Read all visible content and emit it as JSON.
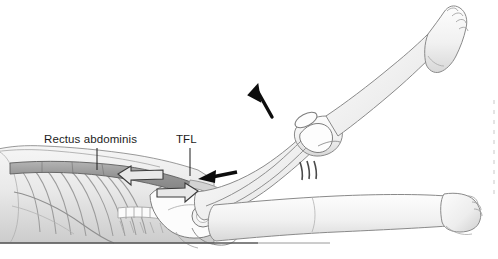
{
  "figure": {
    "background_color": "#ffffff",
    "width": 498,
    "height": 259,
    "style": "grayscale anatomical line drawing"
  },
  "labels": [
    {
      "id": "rectus-abdominis",
      "text": "Rectus abdominis",
      "x": 44,
      "y": 143,
      "leader_line": {
        "x1": 97,
        "y1": 148,
        "x2": 97,
        "y2": 170
      }
    },
    {
      "id": "tfl",
      "text": "TFL",
      "x": 176,
      "y": 143,
      "leader_line": {
        "x1": 190,
        "y1": 148,
        "x2": 190,
        "y2": 176
      }
    }
  ],
  "annotations": {
    "solid_arrows": [
      {
        "id": "leg-raise-arrow",
        "direction": "up-left",
        "color": "#0d0d0d",
        "x": 268,
        "y": 103
      },
      {
        "id": "hip-force-arrow",
        "direction": "left",
        "color": "#0d0d0d",
        "x": 216,
        "y": 176
      }
    ],
    "outline_arrows": [
      {
        "id": "abdominal-pull-arrow",
        "direction": "left",
        "fill": "#e8e8e8",
        "stroke": "#3a3a3a",
        "x": 140,
        "y": 174
      },
      {
        "id": "tfl-pull-arrow",
        "direction": "right",
        "fill": "#e8e8e8",
        "stroke": "#3a3a3a",
        "x": 178,
        "y": 190
      }
    ],
    "motion_lines": {
      "id": "knee-motion-lines",
      "count": 3,
      "glyph": "|||",
      "x": 306,
      "y": 170,
      "color": "#4a4a4a"
    }
  },
  "anatomy": {
    "muscle_band": {
      "name": "rectus abdominis band",
      "fill": "#9a9a9a",
      "stroke": "#5a5a5a"
    },
    "skin": {
      "fill": "#f2f2f2",
      "stroke": "#8a8a8a"
    },
    "bone": {
      "fill": "#fbfbfb",
      "stroke": "#707070"
    },
    "ribs": {
      "count": 9,
      "stroke": "#9c9c9c"
    },
    "table_line": {
      "y": 243,
      "color": "#5a5a5a"
    }
  },
  "colors": {
    "label_text": "#1c1c1c",
    "arrow_solid": "#0d0d0d",
    "arrow_outline_fill": "#e8e8e8",
    "arrow_outline_stroke": "#3a3a3a",
    "background": "#ffffff",
    "edge_marks": "#c9c9c9"
  }
}
